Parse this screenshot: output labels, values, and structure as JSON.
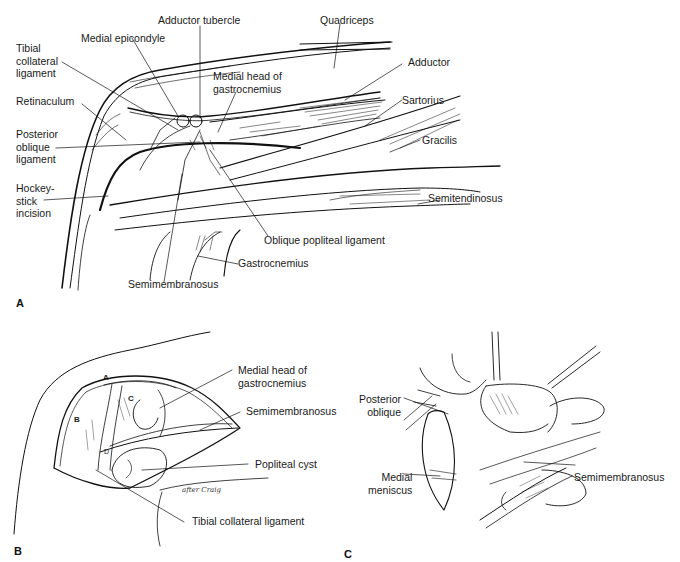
{
  "figure": {
    "panels": [
      {
        "id": "A",
        "letter": "A",
        "labels": {
          "adductor_tubercle": "Adductor tubercle",
          "quadriceps": "Quadriceps",
          "medial_epicondyle": "Medial epicondyle",
          "tibial_collateral_ligament": "Tibial\ncollateral\nligament",
          "medial_head_gastrocnemius": "Medial head of\ngastrocnemius",
          "adductor": "Adductor",
          "retinaculum": "Retinaculum",
          "sartorius": "Sartorius",
          "posterior_oblique_ligament": "Posterior\noblique\nligament",
          "gracilis": "Gracilis",
          "hockey_stick_incision": "Hockey-\nstick\nincision",
          "semitendinosus": "Semitendinosus",
          "oblique_popliteal_ligament": "Oblique popliteal ligament",
          "gastrocnemius": "Gastrocnemius",
          "semimembranosus": "Semimembranosus"
        }
      },
      {
        "id": "B",
        "letter": "B",
        "labels": {
          "medial_head_gastrocnemius": "Medial head of\ngastrocnemius",
          "semimembranosus": "Semimembranosus",
          "popliteal_cyst": "Popliteal cyst",
          "tibial_collateral_ligament": "Tibial collateral ligament"
        },
        "inset_letters": {
          "a": "A",
          "b": "B",
          "c": "C",
          "d": "D"
        },
        "signature": "after Craig"
      },
      {
        "id": "C",
        "letter": "C",
        "labels": {
          "posterior_oblique": "Posterior\noblique",
          "medial_meniscus": "Medial\nmeniscus",
          "semimembranosus": "Semimembranosus"
        }
      }
    ],
    "colors": {
      "ink": "#111111",
      "background": "#ffffff"
    }
  }
}
